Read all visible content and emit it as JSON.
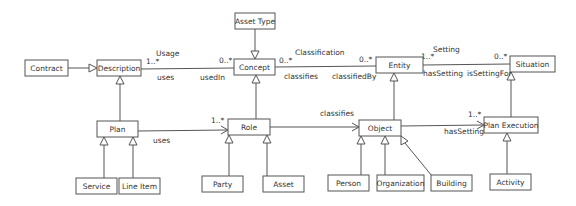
{
  "diagram": {
    "type": "UML class diagram",
    "classes": {
      "contract": "Contract",
      "description": "Description",
      "asset_type": "Asset Type",
      "concept": "Concept",
      "entity": "Entity",
      "situation": "Situation",
      "plan": "Plan",
      "role": "Role",
      "object": "Object",
      "plan_execution": "Plan Execution",
      "service": "Service",
      "line_item": "Line Item",
      "party": "Party",
      "asset": "Asset",
      "person": "Person",
      "organization": "Organization",
      "building": "Building",
      "activity": "Activity"
    },
    "associations": {
      "usage": {
        "name": "Usage",
        "source_role": "uses",
        "target_role": "usedIn",
        "source_multiplicity": "1..*",
        "target_multiplicity": "0..*"
      },
      "classification": {
        "name": "Classification",
        "source_role": "classifies",
        "target_role": "classifiedBy",
        "source_multiplicity": "0..*",
        "target_multiplicity": "0..*"
      },
      "setting": {
        "name": "Setting",
        "source_role": "hasSetting",
        "target_role": "isSettingFor",
        "source_multiplicity": "1..*",
        "target_multiplicity": "0..*"
      },
      "plan_uses_role": {
        "role": "uses",
        "multiplicity": "1..*"
      },
      "role_classifies_object": {
        "role": "classifies"
      },
      "object_has_setting": {
        "role": "hasSetting",
        "multiplicity": "1..*"
      }
    },
    "generalizations": [
      [
        "Contract",
        "Description"
      ],
      [
        "Asset Type",
        "Concept"
      ],
      [
        "Plan",
        "Description"
      ],
      [
        "Role",
        "Concept"
      ],
      [
        "Object",
        "Entity"
      ],
      [
        "Plan Execution",
        "Situation"
      ],
      [
        "Service",
        "Plan"
      ],
      [
        "Line Item",
        "Plan"
      ],
      [
        "Party",
        "Role"
      ],
      [
        "Asset",
        "Role"
      ],
      [
        "Person",
        "Object"
      ],
      [
        "Organization",
        "Object"
      ],
      [
        "Building",
        "Object"
      ],
      [
        "Activity",
        "Plan Execution"
      ]
    ]
  }
}
